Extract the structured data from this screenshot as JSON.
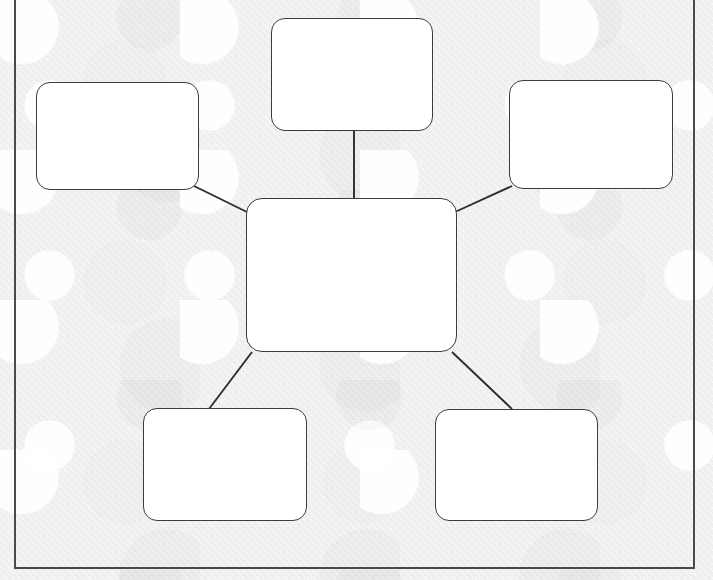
{
  "document": {
    "kind": "mind-map-worksheet",
    "title": "",
    "background_color": "#f1f1f1",
    "paper_color": "#f1f1f1",
    "frame_color": "#4a4a4a",
    "node_fill": "#ffffff",
    "node_stroke": "#3c3c3c",
    "connector_color": "#2d2d2d",
    "all_nodes_blank": true
  },
  "diagram": {
    "type": "mind-map",
    "layout": "hub-and-spoke",
    "node_count": 7,
    "connector_count": 6,
    "nodes": [
      {
        "id": "central",
        "role": "center",
        "label": "",
        "x": 246,
        "y": 198,
        "w": 211,
        "h": 154,
        "corner_radius": 16
      },
      {
        "id": "top-center",
        "role": "branch",
        "label": "",
        "x": 271,
        "y": 18,
        "w": 162,
        "h": 113,
        "corner_radius": 14
      },
      {
        "id": "left",
        "role": "branch",
        "label": "",
        "x": 36,
        "y": 82,
        "w": 163,
        "h": 108,
        "corner_radius": 14
      },
      {
        "id": "right",
        "role": "branch",
        "label": "",
        "x": 509,
        "y": 80,
        "w": 164,
        "h": 109,
        "corner_radius": 14
      },
      {
        "id": "bottom-left",
        "role": "branch",
        "label": "",
        "x": 143,
        "y": 408,
        "w": 164,
        "h": 113,
        "corner_radius": 14
      },
      {
        "id": "bottom-right",
        "role": "branch",
        "label": "",
        "x": 435,
        "y": 409,
        "w": 163,
        "h": 112,
        "corner_radius": 14
      }
    ],
    "connectors": [
      {
        "id": "central-to-top-center",
        "from": "central",
        "to": "top-center",
        "x1": 354,
        "y1": 198,
        "x2": 354,
        "y2": 131
      },
      {
        "id": "central-to-left",
        "from": "central",
        "to": "left",
        "x1": 249,
        "y1": 213,
        "x2": 194,
        "y2": 186
      },
      {
        "id": "central-to-right",
        "from": "central",
        "to": "right",
        "x1": 455,
        "y1": 212,
        "x2": 512,
        "y2": 186
      },
      {
        "id": "central-to-bottom-left",
        "from": "central",
        "to": "bottom-left",
        "x1": 252,
        "y1": 352,
        "x2": 209,
        "y2": 409
      },
      {
        "id": "central-to-bottom-right",
        "from": "central",
        "to": "bottom-right",
        "x1": 452,
        "y1": 352,
        "x2": 512,
        "y2": 409
      }
    ]
  },
  "frame": {
    "x": 14,
    "y": -2,
    "w": 681,
    "h": 571,
    "stroke_width": 2
  }
}
